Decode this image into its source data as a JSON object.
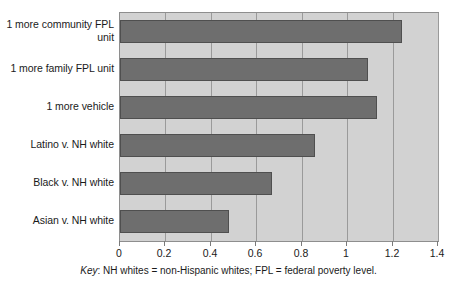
{
  "chart_data": {
    "type": "bar",
    "orientation": "horizontal",
    "title": "",
    "subtitle": "",
    "xlabel": "",
    "ylabel": "",
    "categories": [
      "1 more community FPL unit",
      "1 more family FPL unit",
      "1 more vehicle",
      "Latino v. NH white",
      "Black v. NH white",
      "Asian v. NH white"
    ],
    "values": [
      1.24,
      1.09,
      1.13,
      0.86,
      0.67,
      0.48
    ],
    "xlim": [
      0,
      1.4
    ],
    "xticks": [
      0,
      0.2,
      0.4,
      0.6,
      0.8,
      1,
      1.2,
      1.4
    ],
    "xtick_labels": [
      "0",
      "0.2",
      "0.4",
      "0.6",
      "0.8",
      "1",
      "1.2",
      "1.4"
    ],
    "grid": true,
    "grid_axis": "x",
    "legend": false,
    "bar_color": "#6e6e6e",
    "bar_edge_color": "#4f4f4f",
    "plot_background": "#d2d2d2",
    "gridline_color": "#9a9a9a",
    "figure_background": "#ffffff"
  },
  "key": {
    "label": "Key",
    "separator": ":",
    "text": " NH whites = non-Hispanic whites; FPL = federal poverty level."
  }
}
